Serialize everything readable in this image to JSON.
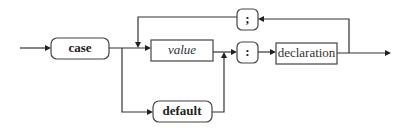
{
  "diagram": {
    "type": "syntax-railroad-diagram",
    "nodes": {
      "case": {
        "label": "case",
        "kind": "terminal"
      },
      "default": {
        "label": "default",
        "kind": "terminal"
      },
      "value": {
        "label": "value",
        "kind": "nonterminal",
        "style": "italic"
      },
      "colon": {
        "label": ":",
        "kind": "terminal"
      },
      "semicolon": {
        "label": ";",
        "kind": "terminal"
      },
      "declaration": {
        "label": "declaration",
        "kind": "nonterminal"
      }
    },
    "edges": [
      {
        "from": "start",
        "to": "case"
      },
      {
        "from": "case",
        "to": "value"
      },
      {
        "from": "case",
        "to": "default"
      },
      {
        "from": "value",
        "to": "colon"
      },
      {
        "from": "default",
        "to": "colon"
      },
      {
        "from": "colon",
        "to": "declaration"
      },
      {
        "from": "declaration",
        "to": "end"
      },
      {
        "from": "declaration",
        "to": "semicolon"
      },
      {
        "from": "semicolon",
        "to": "value"
      }
    ]
  }
}
